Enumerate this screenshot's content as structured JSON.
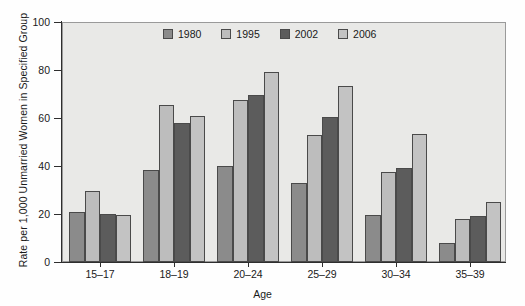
{
  "chart_data": {
    "type": "bar",
    "title": "",
    "xlabel": "Age",
    "ylabel": "Rate per 1,000 Unmarried Women in Specified Group",
    "categories": [
      "15–17",
      "18–19",
      "20–24",
      "25–29",
      "30–34",
      "35–39"
    ],
    "series": [
      {
        "name": "1980",
        "color": "#8b8b8b",
        "values": [
          21,
          38.5,
          40,
          33,
          19.5,
          8
        ]
      },
      {
        "name": "1995",
        "color": "#bdbdbd",
        "values": [
          29.5,
          65.5,
          67.5,
          53,
          37.5,
          18
        ]
      },
      {
        "name": "2002",
        "color": "#5c5c5c",
        "values": [
          20,
          58,
          69.5,
          60.5,
          39,
          19
        ]
      },
      {
        "name": "2006",
        "color": "#c3c3c3",
        "values": [
          19.5,
          61,
          79,
          73.5,
          53.5,
          25
        ]
      }
    ],
    "ylim": [
      0,
      100
    ],
    "yticks": [
      0,
      20,
      40,
      60,
      80,
      100
    ],
    "ytick_labels": [
      "0",
      "20",
      "40",
      "60",
      "80",
      "100"
    ],
    "grid": false,
    "legend_position": "top-center",
    "plot_background": "#e9e9e7",
    "axis_color": "#2e2e2e"
  }
}
